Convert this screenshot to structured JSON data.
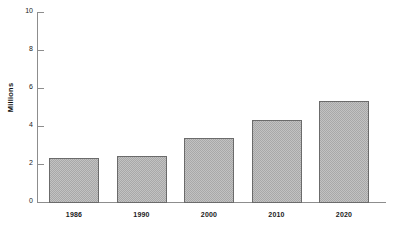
{
  "chart_data": {
    "type": "bar",
    "title": "",
    "subtitle": "",
    "xlabel": "",
    "ylabel": "Millions",
    "categories": [
      "1986",
      "1990",
      "2000",
      "2010",
      "2020"
    ],
    "values": [
      2.33,
      2.43,
      3.38,
      4.29,
      5.34
    ],
    "series": [
      {
        "name": "Millions",
        "values": [
          2.33,
          2.43,
          3.38,
          4.29,
          5.34
        ]
      }
    ],
    "ylim": [
      0,
      10
    ],
    "y_ticks": [
      0,
      2,
      4,
      6,
      8,
      10
    ],
    "y_tick_labels": [
      "0",
      "2",
      "4",
      "6",
      "8",
      "10"
    ],
    "grid": false,
    "legend": false,
    "legend_position": "none",
    "annotations": [],
    "colors": {
      "bar_fill": "#a8a8a8",
      "bar_border": "#6b6b6b",
      "axis": "#8d8d8d",
      "text": "#1a1a1a",
      "background": "#ffffff"
    }
  },
  "axis": {
    "y_title": "Millions"
  }
}
